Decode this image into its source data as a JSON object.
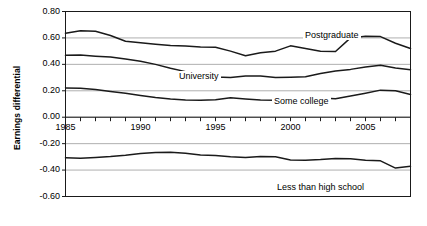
{
  "chart_data": {
    "type": "line",
    "title": "",
    "xlabel": "",
    "ylabel": "Earnings differential",
    "xlim": [
      1985,
      2008
    ],
    "ylim": [
      -0.6,
      0.8
    ],
    "grid": true,
    "legend_position": "inline-labels",
    "y_ticks": [
      "0.80",
      "0.60",
      "0.40",
      "0.20",
      "0.00",
      "-0.20",
      "-0.40",
      "-0.60"
    ],
    "y_tick_values": [
      0.8,
      0.6,
      0.4,
      0.2,
      0.0,
      -0.2,
      -0.4,
      -0.6
    ],
    "x_ticks": [
      "1985",
      "1990",
      "1995",
      "2000",
      "2005"
    ],
    "x_tick_values": [
      1985,
      1990,
      1995,
      2000,
      2005
    ],
    "x": [
      1985,
      1986,
      1987,
      1988,
      1989,
      1990,
      1991,
      1992,
      1993,
      1994,
      1995,
      1996,
      1997,
      1998,
      1999,
      2000,
      2001,
      2002,
      2003,
      2004,
      2005,
      2006,
      2007,
      2008
    ],
    "series": [
      {
        "name": "Postgraduate",
        "label": "Postgraduate",
        "color": "#1a1a1a",
        "values": [
          0.635,
          0.655,
          0.65,
          0.618,
          0.575,
          0.563,
          0.552,
          0.543,
          0.538,
          0.532,
          0.53,
          0.5,
          0.465,
          0.487,
          0.5,
          0.54,
          0.52,
          0.5,
          0.497,
          0.6,
          0.612,
          0.61,
          0.56,
          0.52
        ]
      },
      {
        "name": "University",
        "label": "University",
        "color": "#1a1a1a",
        "values": [
          0.468,
          0.47,
          0.462,
          0.455,
          0.44,
          0.424,
          0.4,
          0.37,
          0.345,
          0.325,
          0.305,
          0.3,
          0.312,
          0.312,
          0.3,
          0.303,
          0.307,
          0.33,
          0.35,
          0.362,
          0.38,
          0.393,
          0.372,
          0.36
        ]
      },
      {
        "name": "Some college",
        "label": "Some college",
        "color": "#1a1a1a",
        "values": [
          0.222,
          0.22,
          0.21,
          0.195,
          0.182,
          0.165,
          0.15,
          0.138,
          0.13,
          0.128,
          0.132,
          0.148,
          0.138,
          0.13,
          0.128,
          0.135,
          0.148,
          0.145,
          0.14,
          0.16,
          0.182,
          0.205,
          0.2,
          0.172
        ]
      },
      {
        "name": "Less than high school",
        "label": "Less than high school",
        "color": "#1a1a1a",
        "values": [
          -0.307,
          -0.31,
          -0.305,
          -0.298,
          -0.288,
          -0.275,
          -0.267,
          -0.265,
          -0.272,
          -0.285,
          -0.29,
          -0.3,
          -0.305,
          -0.297,
          -0.3,
          -0.323,
          -0.325,
          -0.32,
          -0.312,
          -0.315,
          -0.325,
          -0.33,
          -0.385,
          -0.372
        ]
      }
    ]
  },
  "axis": {
    "y_title": "Earnings differential"
  }
}
